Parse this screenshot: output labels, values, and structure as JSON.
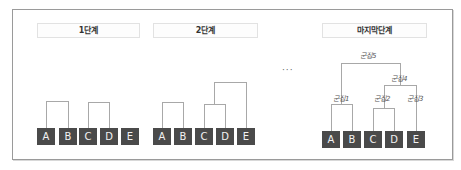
{
  "stages": [
    {
      "label": "1단계",
      "nodes": [
        "A",
        "B",
        "C",
        "D",
        "E"
      ]
    },
    {
      "label": "2단계",
      "nodes": [
        "A",
        "B",
        "C",
        "D",
        "E"
      ]
    },
    {
      "label": "마지막단계",
      "nodes": [
        "A",
        "B",
        "C",
        "D",
        "E"
      ]
    }
  ],
  "ellipsis": "···",
  "clusters": {
    "c1": "군집1",
    "c2": "군집2",
    "c3": "군집3",
    "c4": "군집4",
    "c5": "군집5"
  },
  "colors": {
    "node_fill": "#4a4a4a",
    "node_text": "#f2f2f2",
    "line": "#a8a8a8",
    "frame": "#9a9a9a"
  }
}
